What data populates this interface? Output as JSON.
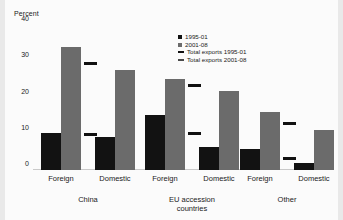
{
  "chart_data": {
    "type": "bar",
    "title": "",
    "ylabel": "Percent",
    "xlabel": "",
    "ylim": [
      0,
      40
    ],
    "yticks": [
      0,
      10,
      20,
      30,
      40
    ],
    "grid": false,
    "legend_position": "top-right",
    "categories": [
      "Foreign",
      "Domestic",
      "Foreign",
      "Domestic",
      "Foreign",
      "Domestic"
    ],
    "groups": [
      {
        "name": "China",
        "label_line1": "China",
        "label_line2": "",
        "subgroups": [
          {
            "name": "Foreign",
            "values": {
              "s1": 10.3,
              "s2": 34.0
            },
            "markers": {
              "m1": 9.5,
              "m2": 29.0
            }
          },
          {
            "name": "Domestic",
            "values": {
              "s1": 9.0,
              "s2": 27.5
            },
            "markers": {
              "m1": null,
              "m2": null
            }
          }
        ]
      },
      {
        "name": "EU accession countries",
        "label_line1": "EU accession",
        "label_line2": "countries",
        "subgroups": [
          {
            "name": "Foreign",
            "values": {
              "s1": 15.2,
              "s2": 25.0
            },
            "markers": {
              "m1": 9.7,
              "m2": 23.0
            }
          },
          {
            "name": "Domestic",
            "values": {
              "s1": 6.3,
              "s2": 21.7
            },
            "markers": {
              "m1": null,
              "m2": null
            }
          }
        ]
      },
      {
        "name": "Other",
        "label_line1": "Other",
        "label_line2": "",
        "subgroups": [
          {
            "name": "Foreign",
            "values": {
              "s1": 5.7,
              "s2": 16.0
            },
            "markers": {
              "m1": 2.9,
              "m2": 12.3
            }
          },
          {
            "name": "Domestic",
            "values": {
              "s1": 2.0,
              "s2": 11.0
            },
            "markers": {
              "m1": null,
              "m2": null
            }
          }
        ]
      }
    ],
    "series": [
      {
        "name": "1995-01",
        "key": "s1",
        "color": "#121212",
        "values": [
          10.3,
          9.0,
          15.2,
          6.3,
          5.7,
          2.0
        ]
      },
      {
        "name": "2001-08",
        "key": "s2",
        "color": "#6b6b6b",
        "values": [
          34.0,
          27.5,
          25.0,
          21.7,
          16.0,
          11.0
        ]
      },
      {
        "name": "Total exports 1995-01",
        "key": "m1",
        "color": "#121212",
        "values": [
          9.5,
          null,
          9.7,
          null,
          2.9,
          null
        ]
      },
      {
        "name": "Total exports 2001-08",
        "key": "m2",
        "color": "#4a4a4a",
        "values": [
          29.0,
          null,
          23.0,
          null,
          12.3,
          null
        ]
      }
    ]
  },
  "axis": {
    "y_title": "Percent",
    "tick_40": "40",
    "tick_30": "30",
    "tick_20": "20",
    "tick_10": "10",
    "tick_0": "0"
  },
  "legend": {
    "items": [
      {
        "label": "1995-01",
        "marker": "filled-square-dark"
      },
      {
        "label": "2001-08",
        "marker": "filled-square-gray"
      },
      {
        "label": "Total exports 1995-01",
        "marker": "line-dark"
      },
      {
        "label": "Total exports 2001-08",
        "marker": "line-gray"
      }
    ]
  },
  "x_labels": {
    "china_foreign": "Foreign",
    "china_domestic": "Domestic",
    "eu_foreign": "Foreign",
    "eu_domestic": "Domestic",
    "other_foreign": "Foreign",
    "other_domestic": "Domestic",
    "group_china": "China",
    "group_eu_l1": "EU accession",
    "group_eu_l2": "countries",
    "group_other": "Other"
  }
}
